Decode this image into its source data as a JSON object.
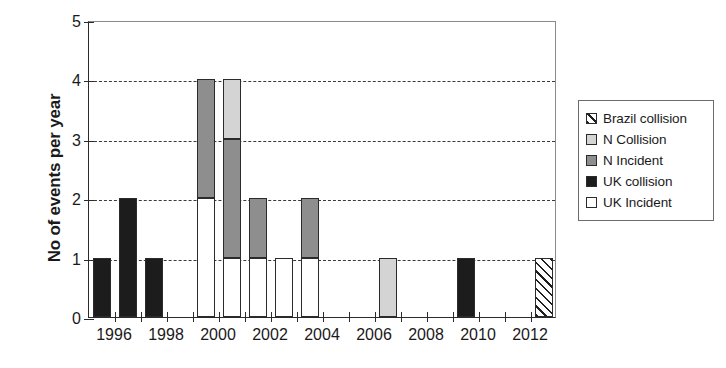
{
  "chart_data": {
    "type": "bar",
    "title": "",
    "subtitle": "",
    "xlabel": "",
    "ylabel": "No of events per year",
    "stacked": true,
    "grid": true,
    "grid_style": "dashed horizontal",
    "legend_position": "right",
    "ylim": [
      0,
      5
    ],
    "ytick_labels": [
      "0",
      "1",
      "2",
      "3",
      "4",
      "5"
    ],
    "ytick_values": [
      0,
      1,
      2,
      3,
      4,
      5
    ],
    "xlim": [
      1995,
      2013
    ],
    "xtick_labels": [
      "1996",
      "1998",
      "2000",
      "2002",
      "2004",
      "2006",
      "2008",
      "2010",
      "2012"
    ],
    "xtick_values": [
      1996,
      1998,
      2000,
      2002,
      2004,
      2006,
      2008,
      2010,
      2012
    ],
    "categories": [
      1995,
      1996,
      1997,
      1998,
      1999,
      2000,
      2001,
      2002,
      2003,
      2004,
      2005,
      2006,
      2007,
      2008,
      2009,
      2010,
      2011,
      2012
    ],
    "series": [
      {
        "name": "UK Incident",
        "color": "#ffffff",
        "pattern": "solid",
        "values": [
          0,
          0,
          0,
          0,
          2,
          1,
          1,
          1,
          1,
          0,
          0,
          0,
          0,
          0,
          0,
          0,
          0,
          0
        ]
      },
      {
        "name": "UK collision",
        "color": "#1c1c1c",
        "pattern": "solid",
        "values": [
          1,
          2,
          1,
          0,
          0,
          0,
          0,
          0,
          0,
          0,
          0,
          0,
          0,
          0,
          1,
          0,
          0,
          0
        ]
      },
      {
        "name": "N Incident",
        "color": "#8e8e8e",
        "pattern": "solid",
        "values": [
          0,
          0,
          0,
          0,
          2,
          2,
          1,
          0,
          1,
          0,
          0,
          0,
          0,
          0,
          0,
          0,
          0,
          0
        ]
      },
      {
        "name": "N Collision",
        "color": "#d4d4d4",
        "pattern": "solid",
        "values": [
          0,
          0,
          0,
          0,
          0,
          1,
          0,
          0,
          0,
          0,
          0,
          1,
          0,
          0,
          0,
          0,
          0,
          0
        ]
      },
      {
        "name": "Brazil collision",
        "color": "#ffffff",
        "pattern": "diagonal-hatch",
        "values": [
          0,
          0,
          0,
          0,
          0,
          0,
          0,
          0,
          0,
          0,
          0,
          0,
          0,
          0,
          0,
          0,
          0,
          1
        ]
      }
    ],
    "totals": [
      1,
      2,
      1,
      0,
      4,
      4,
      2,
      1,
      2,
      0,
      0,
      1,
      0,
      0,
      1,
      0,
      0,
      1
    ]
  },
  "legend": {
    "items": [
      {
        "label": "Brazil collision",
        "fill": "brazil"
      },
      {
        "label": "N Collision",
        "fill": "n-collision"
      },
      {
        "label": "N Incident",
        "fill": "n-incident"
      },
      {
        "label": "UK collision",
        "fill": "uk-collision"
      },
      {
        "label": "UK Incident",
        "fill": "uk-incident"
      }
    ]
  }
}
